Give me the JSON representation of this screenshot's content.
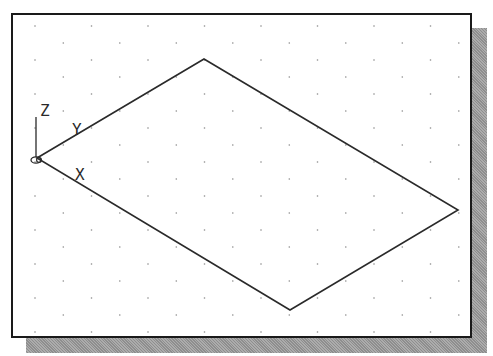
{
  "viewport": {
    "grid": {
      "style": "isometric-dots",
      "spacing_x": 56.5,
      "spacing_y": 17,
      "dot_color": "#8a8a8a"
    },
    "shape": {
      "type": "parallelogram",
      "vertices": [
        [
          37,
          158
        ],
        [
          204,
          59
        ],
        [
          458,
          210
        ],
        [
          290,
          310
        ]
      ],
      "stroke": "#2a2a2a"
    },
    "ucs_icon": {
      "labels": {
        "z": "Z",
        "y": "Y",
        "x": "X"
      }
    }
  },
  "colors": {
    "frame": "#1a1a1a",
    "shadow": "#9a9a9a",
    "background": "#ffffff"
  }
}
